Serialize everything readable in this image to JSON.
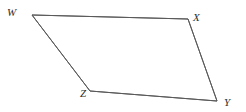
{
  "figure": {
    "kind": "quadrilateral-diagram",
    "background_color": "#ffffff",
    "stroke_color": "#5a5a5a",
    "stroke_width": 1,
    "label_color": "#2e2e2e",
    "vertices": [
      {
        "id": "W",
        "label": "W",
        "x": 32,
        "y": 15
      },
      {
        "id": "X",
        "label": "X",
        "x": 188,
        "y": 19
      },
      {
        "id": "Y",
        "label": "Y",
        "x": 217,
        "y": 101
      },
      {
        "id": "Z",
        "label": "Z",
        "x": 90,
        "y": 91
      }
    ],
    "edges": [
      {
        "id": "WX",
        "from": "W",
        "to": "X"
      },
      {
        "id": "XY",
        "from": "X",
        "to": "Y"
      },
      {
        "id": "YZ",
        "from": "Y",
        "to": "Z"
      },
      {
        "id": "ZW",
        "from": "Z",
        "to": "W"
      }
    ],
    "polygon_points": "32,15 188,19 217,101 90,91"
  }
}
